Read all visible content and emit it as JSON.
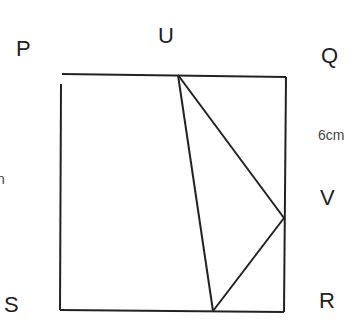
{
  "diagram": {
    "vertices": {
      "P": {
        "label": "P"
      },
      "Q": {
        "label": "Q"
      },
      "R": {
        "label": "R"
      },
      "S": {
        "label": "S"
      },
      "U": {
        "label": "U"
      },
      "V": {
        "label": "V"
      }
    },
    "measurements": {
      "qv": {
        "label": "6cm"
      },
      "left_partial": {
        "label": "n"
      }
    },
    "colors": {
      "stroke": "#222222",
      "text": "#222222",
      "background": "#ffffff"
    },
    "shapes": {
      "rectangle": {
        "corners": [
          [
            62,
            74
          ],
          [
            286,
            77
          ],
          [
            284,
            312
          ],
          [
            60,
            310
          ]
        ]
      },
      "triangle": {
        "points": [
          [
            178,
            75
          ],
          [
            284,
            218
          ],
          [
            213,
            311
          ]
        ]
      }
    }
  }
}
